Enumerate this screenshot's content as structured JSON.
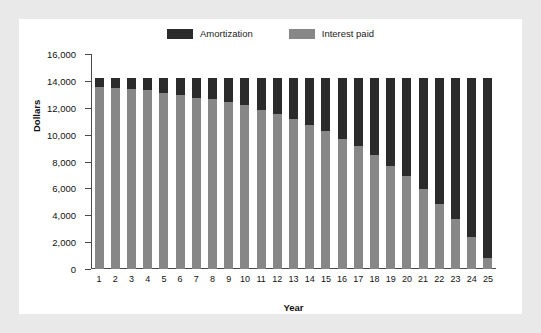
{
  "chart_data": {
    "type": "bar",
    "subtype": "stacked-bar",
    "title": "",
    "xlabel": "Year",
    "ylabel": "Dollars",
    "categories": [
      "1",
      "2",
      "3",
      "4",
      "5",
      "6",
      "7",
      "8",
      "9",
      "10",
      "11",
      "12",
      "13",
      "14",
      "15",
      "16",
      "17",
      "18",
      "19",
      "20",
      "21",
      "22",
      "23",
      "24",
      "25"
    ],
    "series": [
      {
        "name": "Interest paid",
        "color": "#878787",
        "values": [
          13550,
          13450,
          13400,
          13320,
          13120,
          12950,
          12720,
          12630,
          12400,
          12200,
          11800,
          11520,
          11170,
          10750,
          10280,
          9700,
          9120,
          8460,
          7700,
          6950,
          5930,
          4870,
          3720,
          2350,
          850
        ]
      },
      {
        "name": "Amortization",
        "color": "#2b2b2b",
        "values": [
          700,
          800,
          850,
          930,
          1130,
          1300,
          1530,
          1620,
          1850,
          2050,
          2450,
          2730,
          3080,
          3500,
          3970,
          4550,
          5130,
          5790,
          6550,
          7300,
          8320,
          9380,
          10530,
          11900,
          13400
        ]
      }
    ],
    "stack_total": 14250,
    "ylim": [
      0,
      16000
    ],
    "yticks": [
      0,
      2000,
      4000,
      6000,
      8000,
      10000,
      12000,
      14000,
      16000
    ],
    "ytick_labels": [
      "0",
      "2,000",
      "4,000",
      "6,000",
      "8,000",
      "10,000",
      "12,000",
      "14,000",
      "16,000"
    ],
    "grid": false,
    "legend_position": "top-center",
    "legend_entries": [
      "Amortization",
      "Interest paid"
    ]
  },
  "legend": {
    "items": [
      {
        "label": "Amortization",
        "color": "#2b2b2b"
      },
      {
        "label": "Interest paid",
        "color": "#878787"
      }
    ]
  },
  "axes": {
    "x_title": "Year",
    "y_title": "Dollars"
  },
  "colors": {
    "page_background": "#e9e9e9",
    "panel_background": "#ffffff",
    "axis": "#4a4a4a",
    "amortization": "#2b2b2b",
    "interest": "#878787",
    "text": "#111111"
  }
}
